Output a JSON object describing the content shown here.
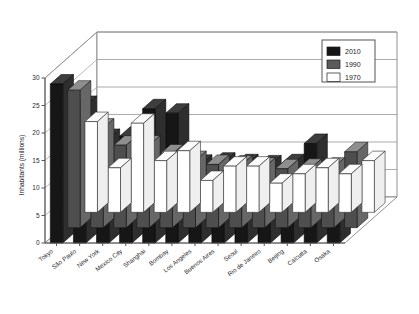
{
  "chart_data": {
    "type": "bar",
    "title": "",
    "subtitle": "",
    "xlabel": "",
    "ylabel": "Inhabitants (millions)",
    "ylim": [
      0,
      30
    ],
    "yticks": [
      0,
      5,
      10,
      15,
      20,
      25,
      30
    ],
    "ytick_labels": [
      "0",
      "5",
      "10",
      "15",
      "20",
      "25",
      "30"
    ],
    "grid": true,
    "legend_position": "top-right",
    "projection": "3d-grouped-bars",
    "categories": [
      "Tokyo",
      "São Paulo",
      "New York",
      "Mexico City",
      "Shanghai",
      "Bombay",
      "Los Angeles",
      "Buenos Aires",
      "Seoul",
      "Rio de Janeiro",
      "Beijing",
      "Calcutta",
      "Osaka"
    ],
    "series": [
      {
        "name": "1970",
        "color": "#ffffff",
        "values": [
          16.5,
          8.1,
          16.2,
          9.4,
          11.2,
          5.8,
          8.4,
          8.4,
          5.3,
          7.0,
          8.1,
          7.0,
          9.4
        ]
      },
      {
        "name": "1990",
        "color": "#4e4e4e",
        "values": [
          25.0,
          18.1,
          15.0,
          15.0,
          13.4,
          12.2,
          11.5,
          11.4,
          11.0,
          10.7,
          10.8,
          11.0,
          13.8
        ]
      },
      {
        "name": "2010",
        "color": "#161616",
        "values": [
          28.9,
          25.0,
          19.0,
          19.4,
          24.4,
          23.6,
          14.3,
          14.7,
          14.4,
          14.2,
          14.4,
          18.1,
          11.0
        ]
      }
    ]
  },
  "legend": {
    "entries": [
      {
        "label": "2010",
        "swatch": "black"
      },
      {
        "label": "1990",
        "swatch": "gray"
      },
      {
        "label": "1970",
        "swatch": "white"
      }
    ]
  },
  "axis": {
    "y_title": "Inhabitants (millions)"
  }
}
